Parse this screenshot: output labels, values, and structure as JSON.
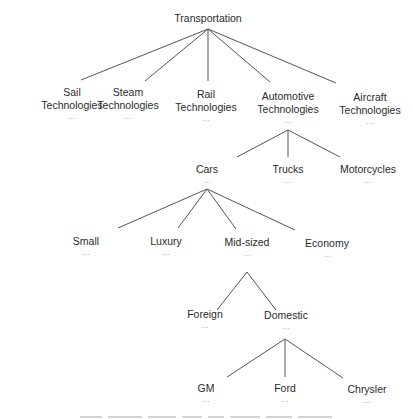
{
  "diagram": {
    "type": "tree",
    "root": {
      "id": "transportation",
      "label": "Transportation"
    },
    "nodes": [
      {
        "id": "transportation",
        "label": "Transportation",
        "dots": "",
        "x": 208,
        "y": 12
      },
      {
        "id": "sail",
        "label1": "Sail",
        "label2": "Technologies",
        "dots": "...",
        "x": 72,
        "y": 86
      },
      {
        "id": "steam",
        "label1": "Steam",
        "label2": "Technologies",
        "dots": "...",
        "x": 128,
        "y": 86
      },
      {
        "id": "rail",
        "label1": "Rail",
        "label2": "Technologies",
        "dots": "...",
        "x": 206,
        "y": 88
      },
      {
        "id": "automotive",
        "label1": "Automotive",
        "label2": "Technologies",
        "dots": "...",
        "x": 288,
        "y": 90
      },
      {
        "id": "aircraft",
        "label1": "Aircraft",
        "label2": "Technologies",
        "dots": "...",
        "x": 370,
        "y": 91
      },
      {
        "id": "cars",
        "label": "Cars",
        "dots": "...",
        "x": 207,
        "y": 163
      },
      {
        "id": "trucks",
        "label": "Trucks",
        "dots": "...",
        "x": 288,
        "y": 163
      },
      {
        "id": "motorcycles",
        "label": "Motorcycles",
        "dots": "...",
        "x": 368,
        "y": 163
      },
      {
        "id": "small",
        "label": "Small",
        "dots": "...",
        "x": 86,
        "y": 235
      },
      {
        "id": "luxury",
        "label": "Luxury",
        "dots": "...",
        "x": 166,
        "y": 235
      },
      {
        "id": "midsized",
        "label": "Mid-sized",
        "dots": "...",
        "x": 247,
        "y": 236
      },
      {
        "id": "economy",
        "label": "Economy",
        "dots": "...",
        "x": 327,
        "y": 237
      },
      {
        "id": "foreign",
        "label": "Foreign",
        "dots": "...",
        "x": 205,
        "y": 308
      },
      {
        "id": "domestic",
        "label": "Domestic",
        "dots": "...",
        "x": 286,
        "y": 309
      },
      {
        "id": "gm",
        "label": "GM",
        "dots": "...",
        "x": 206,
        "y": 382
      },
      {
        "id": "ford",
        "label": "Ford",
        "dots": "...",
        "x": 285,
        "y": 382
      },
      {
        "id": "chrysler",
        "label": "Chrysler",
        "dots": "...",
        "x": 367,
        "y": 383
      }
    ],
    "edges": [
      {
        "from": "transportation",
        "to": "sail",
        "x1": 208,
        "y1": 29,
        "x2": 81,
        "y2": 80
      },
      {
        "from": "transportation",
        "to": "steam",
        "x1": 208,
        "y1": 29,
        "x2": 145,
        "y2": 81
      },
      {
        "from": "transportation",
        "to": "rail",
        "x1": 208,
        "y1": 29,
        "x2": 208,
        "y2": 81
      },
      {
        "from": "transportation",
        "to": "automotive",
        "x1": 208,
        "y1": 29,
        "x2": 270,
        "y2": 82
      },
      {
        "from": "transportation",
        "to": "aircraft",
        "x1": 208,
        "y1": 29,
        "x2": 336,
        "y2": 83
      },
      {
        "from": "automotive",
        "to": "cars",
        "x1": 288,
        "y1": 130,
        "x2": 237,
        "y2": 157
      },
      {
        "from": "automotive",
        "to": "trucks",
        "x1": 288,
        "y1": 130,
        "x2": 288,
        "y2": 157
      },
      {
        "from": "automotive",
        "to": "motorcycles",
        "x1": 288,
        "y1": 130,
        "x2": 340,
        "y2": 157
      },
      {
        "from": "cars",
        "to": "small",
        "x1": 207,
        "y1": 189,
        "x2": 118,
        "y2": 228
      },
      {
        "from": "cars",
        "to": "luxury",
        "x1": 207,
        "y1": 189,
        "x2": 178,
        "y2": 228
      },
      {
        "from": "cars",
        "to": "midsized",
        "x1": 207,
        "y1": 189,
        "x2": 236,
        "y2": 229
      },
      {
        "from": "cars",
        "to": "economy",
        "x1": 207,
        "y1": 189,
        "x2": 295,
        "y2": 230
      },
      {
        "from": "midsized",
        "to": "foreign",
        "x1": 247,
        "y1": 272,
        "x2": 217,
        "y2": 310
      },
      {
        "from": "midsized",
        "to": "domestic",
        "x1": 247,
        "y1": 272,
        "x2": 276,
        "y2": 310
      },
      {
        "from": "domestic",
        "to": "gm",
        "x1": 285,
        "y1": 339,
        "x2": 227,
        "y2": 377
      },
      {
        "from": "domestic",
        "to": "ford",
        "x1": 285,
        "y1": 339,
        "x2": 285,
        "y2": 377
      },
      {
        "from": "domestic",
        "to": "chrysler",
        "x1": 285,
        "y1": 339,
        "x2": 343,
        "y2": 378
      }
    ],
    "caption": {
      "legible": false,
      "text": ""
    }
  }
}
